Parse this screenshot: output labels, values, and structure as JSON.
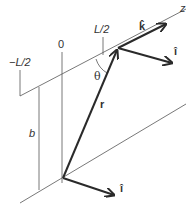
{
  "labels": {
    "z_axis": "z",
    "minus_half_L": "−L/2",
    "zero": "0",
    "half_L": "L/2",
    "b": "b",
    "theta": "θ",
    "r": "r",
    "k_hat": "k̂",
    "i_hat_upper": "î",
    "i_hat_lower": "î"
  },
  "colors": {
    "thin_line": "#555555",
    "vector": "#2a2a2a",
    "text": "#333333"
  }
}
